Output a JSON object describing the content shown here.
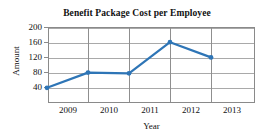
{
  "chart_data": {
    "type": "line",
    "title": "Benefit Package Cost per Employee",
    "xlabel": "Year",
    "ylabel": "Amount",
    "categories": [
      "2009",
      "2010",
      "2011",
      "2012",
      "2013"
    ],
    "values": [
      40,
      80,
      78,
      160,
      120
    ],
    "series": [
      {
        "name": "Benefit Package Cost",
        "values": [
          40,
          80,
          78,
          160,
          120
        ],
        "color": "#2E75B6",
        "marker": "circle"
      }
    ],
    "ylim": [
      0,
      200
    ],
    "yticks": [
      40,
      80,
      120,
      160,
      200
    ],
    "ytick_labels": [
      "40",
      "80",
      "120",
      "160",
      "200"
    ],
    "xtick_labels": [
      "2009",
      "2010",
      "2011",
      "2012",
      "2013"
    ],
    "grid": true,
    "grid_color": "#a9a9a9",
    "legend": false,
    "legend_position": "none",
    "frame_color": "#8a8a8a",
    "background": "#ffffff"
  }
}
